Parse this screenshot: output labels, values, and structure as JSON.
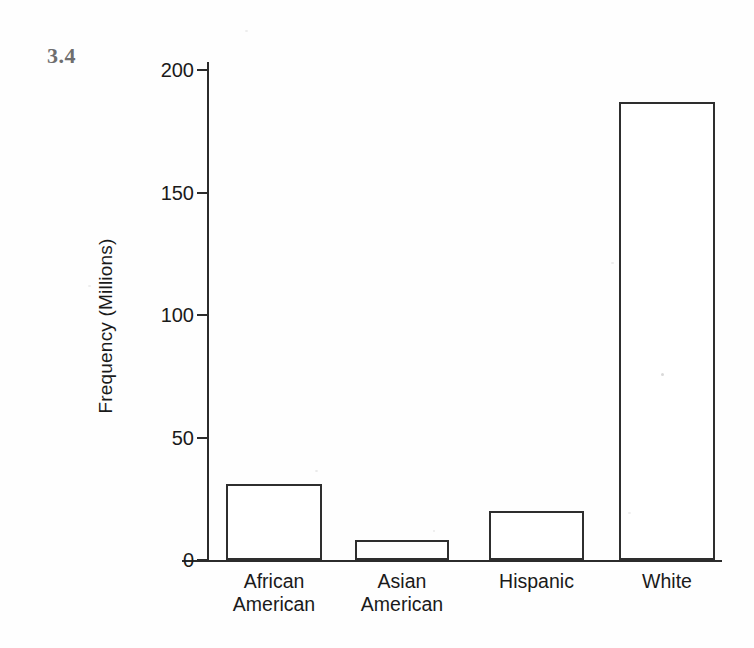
{
  "figure": {
    "number_label": "3.4"
  },
  "chart_data": {
    "type": "bar",
    "title": "",
    "xlabel": "",
    "ylabel": "Frequency (Millions)",
    "categories": [
      "African American",
      "Asian American",
      "Hispanic",
      "White"
    ],
    "category_lines": [
      [
        "African",
        "American"
      ],
      [
        "Asian",
        "American"
      ],
      [
        "Hispanic"
      ],
      [
        "White"
      ]
    ],
    "values": [
      31,
      8,
      20,
      187
    ],
    "ylim": [
      0,
      200
    ],
    "yticks": [
      0,
      50,
      100,
      150,
      200
    ],
    "ytick_labels": [
      "0",
      "50",
      "100",
      "150",
      "200"
    ],
    "grid": false,
    "legend": false,
    "bar_fill": "#ffffff",
    "bar_edge": "#2e2e2e",
    "axis_color": "#2b2b2b",
    "background": "#ffffff"
  }
}
